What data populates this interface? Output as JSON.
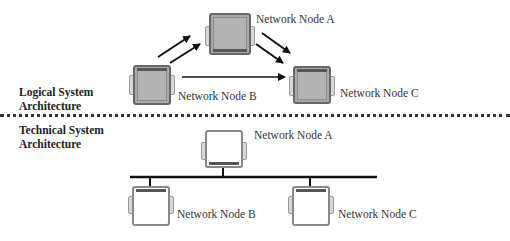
{
  "sections": {
    "logical": {
      "label_line1": "Logical System",
      "label_line2": "Architecture"
    },
    "technical": {
      "label_line1": "Technical System",
      "label_line2": "Architecture"
    }
  },
  "logical_nodes": [
    {
      "id": "A",
      "label": "Network Node A"
    },
    {
      "id": "B",
      "label": "Network Node B"
    },
    {
      "id": "C",
      "label": "Network Node C"
    }
  ],
  "technical_nodes": [
    {
      "id": "A",
      "label": "Network Node A"
    },
    {
      "id": "B",
      "label": "Network Node B"
    },
    {
      "id": "C",
      "label": "Network Node C"
    }
  ],
  "logical_connections": [
    {
      "from": "B",
      "to": "A",
      "type": "double-arrow"
    },
    {
      "from": "A",
      "to": "C",
      "type": "double-arrow"
    },
    {
      "from": "B",
      "to": "C",
      "type": "arrow"
    }
  ],
  "technical_connections": {
    "type": "bus",
    "members": [
      "A",
      "B",
      "C"
    ]
  },
  "colors": {
    "logical_node_fill": "#a9a9a9",
    "technical_node_fill": "#ffffff",
    "line": "#111111"
  }
}
